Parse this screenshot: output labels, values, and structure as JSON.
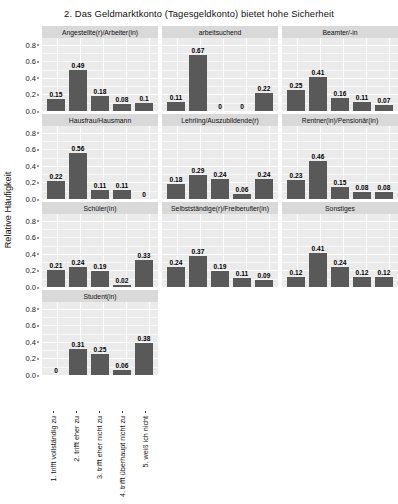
{
  "chart_data": {
    "type": "bar",
    "title": "2. Das Geldmarktkonto (Tagesgeldkonto) bietet hohe Sicherheit",
    "xlabel": "",
    "ylabel": "Relative Häufigkeit",
    "ylim": [
      0,
      0.88
    ],
    "yticks": [
      "0.0",
      "0.2",
      "0.4",
      "0.6",
      "0.8"
    ],
    "ytick_values": [
      0.0,
      0.2,
      0.4,
      0.6,
      0.8
    ],
    "grid": true,
    "legend": "none",
    "facet_layout": "3 columns x 4 rows",
    "categories": [
      "1. trifft vollständig zu",
      "2. trifft eher zu",
      "3. trifft eher nicht zu",
      "4. trifft überhaupt nicht zu",
      "5. weiß ich nicht"
    ],
    "panels": [
      {
        "name": "Angestellte(r)/Arbeiter(in)",
        "values": [
          0.15,
          0.49,
          0.18,
          0.08,
          0.1
        ],
        "labels": [
          "0.15",
          "0.49",
          "0.18",
          "0.08",
          "0.1"
        ]
      },
      {
        "name": "arbeitsuchend",
        "values": [
          0.11,
          0.67,
          0,
          0,
          0.22
        ],
        "labels": [
          "0.11",
          "0.67",
          "0",
          "0",
          "0.22"
        ]
      },
      {
        "name": "Beamter/-in",
        "values": [
          0.25,
          0.41,
          0.16,
          0.11,
          0.07
        ],
        "labels": [
          "0.25",
          "0.41",
          "0.16",
          "0.11",
          "0.07"
        ]
      },
      {
        "name": "Hausfrau/Hausmann",
        "values": [
          0.22,
          0.56,
          0.11,
          0.11,
          0
        ],
        "labels": [
          "0.22",
          "0.56",
          "0.11",
          "0.11",
          "0"
        ]
      },
      {
        "name": "Lehrling/Auszubildende(r)",
        "values": [
          0.18,
          0.29,
          0.24,
          0.06,
          0.24
        ],
        "labels": [
          "0.18",
          "0.29",
          "0.24",
          "0.06",
          "0.24"
        ]
      },
      {
        "name": "Rentner(in)/Pensionär(in)",
        "values": [
          0.23,
          0.46,
          0.15,
          0.08,
          0.08
        ],
        "labels": [
          "0.23",
          "0.46",
          "0.15",
          "0.08",
          "0.08"
        ]
      },
      {
        "name": "Schüler(in)",
        "values": [
          0.21,
          0.24,
          0.19,
          0.02,
          0.33
        ],
        "labels": [
          "0.21",
          "0.24",
          "0.19",
          "0.02",
          "0.33"
        ]
      },
      {
        "name": "Selbstständige(r)/Freiberufler(in)",
        "values": [
          0.24,
          0.37,
          0.19,
          0.11,
          0.09
        ],
        "labels": [
          "0.24",
          "0.37",
          "0.19",
          "0.11",
          "0.09"
        ]
      },
      {
        "name": "Sonstiges",
        "values": [
          0.12,
          0.41,
          0.24,
          0.12,
          0.12
        ],
        "labels": [
          "0.12",
          "0.41",
          "0.24",
          "0.12",
          "0.12"
        ]
      },
      {
        "name": "Student(in)",
        "values": [
          0,
          0.31,
          0.25,
          0.06,
          0.38
        ],
        "labels": [
          "0",
          "0.31",
          "0.25",
          "0.06",
          "0.38"
        ]
      }
    ],
    "colors": {
      "bar": "#595959",
      "panel_background": "#ebebeb",
      "strip_background": "#d9d9d9",
      "gridline": "#ffffff",
      "text": "#111111"
    }
  }
}
